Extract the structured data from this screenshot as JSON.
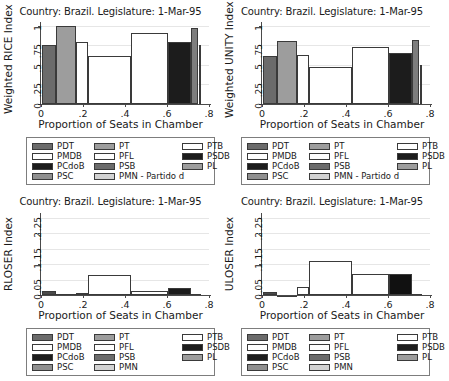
{
  "chart_data": [
    {
      "id": "weighted-rice",
      "type": "bar",
      "title": "Country: Brazil.  Legislature: 1-Mar-95",
      "xlabel": "Proportion of Seats in Chamber",
      "ylabel": "Weighted RICE Index",
      "xlim": [
        0,
        0.8
      ],
      "ylim": [
        0,
        1.05
      ],
      "xticks": [
        "0",
        ".2",
        ".4",
        ".6",
        ".8"
      ],
      "xtickvals": [
        0,
        0.2,
        0.4,
        0.6,
        0.8
      ],
      "yticks": [
        "0",
        ".25",
        ".5",
        ".75",
        "1"
      ],
      "ytickvals": [
        0,
        0.25,
        0.5,
        0.75,
        1
      ],
      "grid": true,
      "bars": [
        {
          "party": "PMDB_dark",
          "x0": 0.005,
          "x1": 0.072,
          "value": 0.75,
          "color": "#6b6b6b"
        },
        {
          "party": "PT",
          "x0": 0.072,
          "x1": 0.165,
          "value": 1.0,
          "color": "#9d9d9d"
        },
        {
          "party": "PFL",
          "x0": 0.165,
          "x1": 0.222,
          "value": 0.79,
          "color": "#ffffff"
        },
        {
          "party": "PPR",
          "x0": 0.222,
          "x1": 0.428,
          "value": 0.61,
          "color": "#ffffff"
        },
        {
          "party": "PTB",
          "x0": 0.428,
          "x1": 0.607,
          "value": 0.905,
          "color": "#ffffff"
        },
        {
          "party": "PSDB",
          "x0": 0.607,
          "x1": 0.715,
          "value": 0.8,
          "color": "#1c1c1c"
        },
        {
          "party": "PL",
          "x0": 0.715,
          "x1": 0.75,
          "value": 0.975,
          "color": "#7d7d7d"
        },
        {
          "party": "PMN",
          "x0": 0.75,
          "x1": 0.762,
          "value": 0.75,
          "color": "#ffffff"
        }
      ]
    },
    {
      "id": "weighted-unity",
      "type": "bar",
      "title": "Country: Brazil.  Legislature: 1-Mar-95",
      "xlabel": "Proportion of Seats in Chamber",
      "ylabel": "Weighted UNITY Index",
      "xlim": [
        0,
        0.8
      ],
      "ylim": [
        0,
        1.05
      ],
      "xticks": [
        "0",
        ".2",
        ".4",
        ".6",
        ".8"
      ],
      "xtickvals": [
        0,
        0.2,
        0.4,
        0.6,
        0.8
      ],
      "yticks": [
        "0",
        ".25",
        ".5",
        ".75",
        "1"
      ],
      "ytickvals": [
        0,
        0.25,
        0.5,
        0.75,
        1
      ],
      "grid": true,
      "bars": [
        {
          "party": "PMDB_dark",
          "x0": 0.005,
          "x1": 0.072,
          "value": 0.615,
          "color": "#6b6b6b"
        },
        {
          "party": "PT",
          "x0": 0.072,
          "x1": 0.165,
          "value": 0.805,
          "color": "#9d9d9d"
        },
        {
          "party": "PFL",
          "x0": 0.165,
          "x1": 0.222,
          "value": 0.625,
          "color": "#ffffff"
        },
        {
          "party": "PPR",
          "x0": 0.222,
          "x1": 0.428,
          "value": 0.48,
          "color": "#ffffff"
        },
        {
          "party": "PTB",
          "x0": 0.428,
          "x1": 0.607,
          "value": 0.735,
          "color": "#ffffff"
        },
        {
          "party": "PSDB",
          "x0": 0.607,
          "x1": 0.715,
          "value": 0.655,
          "color": "#1c1c1c"
        },
        {
          "party": "PL",
          "x0": 0.715,
          "x1": 0.75,
          "value": 0.815,
          "color": "#7d7d7d"
        },
        {
          "party": "PMN",
          "x0": 0.75,
          "x1": 0.762,
          "value": 0.5,
          "color": "#ffffff"
        }
      ]
    },
    {
      "id": "rloser",
      "type": "bar",
      "title": "Country: Brazil.  Legislature: 1-Mar-95",
      "xlabel": "Proportion of Seats in Chamber",
      "ylabel": "RLOSER Index",
      "xlim": [
        0,
        0.8
      ],
      "ylim": [
        0,
        0.265
      ],
      "xticks": [
        "0",
        ".2",
        ".4",
        ".6",
        ".8"
      ],
      "xtickvals": [
        0,
        0.2,
        0.4,
        0.6,
        0.8
      ],
      "yticks": [
        "0",
        ".05",
        ".1",
        ".15",
        ".2",
        ".25"
      ],
      "ytickvals": [
        0,
        0.05,
        0.1,
        0.15,
        0.2,
        0.25
      ],
      "grid": true,
      "bars": [
        {
          "party": "PMDB_dark",
          "x0": 0.005,
          "x1": 0.072,
          "value": 0.0125,
          "color": "#4a4a4a"
        },
        {
          "party": "PT",
          "x0": 0.072,
          "x1": 0.165,
          "value": 0.002,
          "color": "#ffffff"
        },
        {
          "party": "PFL",
          "x0": 0.165,
          "x1": 0.222,
          "value": 0.0075,
          "color": "#ffffff"
        },
        {
          "party": "PPR",
          "x0": 0.222,
          "x1": 0.428,
          "value": 0.0655,
          "color": "#ffffff"
        },
        {
          "party": "PTB",
          "x0": 0.428,
          "x1": 0.607,
          "value": 0.0135,
          "color": "#ffffff"
        },
        {
          "party": "PSDB",
          "x0": 0.607,
          "x1": 0.715,
          "value": 0.0215,
          "color": "#1c1c1c"
        },
        {
          "party": "PL",
          "x0": 0.715,
          "x1": 0.762,
          "value": 0.0035,
          "color": "#6b6b6b"
        }
      ]
    },
    {
      "id": "uloser",
      "type": "bar",
      "title": "Country: Brazil.  Legislature: 1-Mar-95",
      "xlabel": "Proportion of Seats in Chamber",
      "ylabel": "ULOSER Index",
      "xlim": [
        0,
        0.8
      ],
      "ylim": [
        0,
        0.265
      ],
      "xticks": [
        "0",
        ".2",
        ".4",
        ".6",
        ".8"
      ],
      "xtickvals": [
        0,
        0.2,
        0.4,
        0.6,
        0.8
      ],
      "yticks": [
        "0",
        ".05",
        ".1",
        ".15",
        ".2",
        ".25"
      ],
      "ytickvals": [
        0,
        0.05,
        0.1,
        0.15,
        0.2,
        0.25
      ],
      "grid": true,
      "bars": [
        {
          "party": "PMDB_dark",
          "x0": 0.005,
          "x1": 0.072,
          "value": 0.0095,
          "color": "#4a4a4a"
        },
        {
          "party": "PT",
          "x0": 0.072,
          "x1": 0.165,
          "value": 0.0015,
          "color": "#ffffff"
        },
        {
          "party": "PFL",
          "x0": 0.165,
          "x1": 0.222,
          "value": 0.0255,
          "color": "#ffffff"
        },
        {
          "party": "PPR",
          "x0": 0.222,
          "x1": 0.428,
          "value": 0.1095,
          "color": "#ffffff"
        },
        {
          "party": "PTB",
          "x0": 0.428,
          "x1": 0.607,
          "value": 0.0665,
          "color": "#ffffff"
        },
        {
          "party": "PSDB",
          "x0": 0.607,
          "x1": 0.715,
          "value": 0.0675,
          "color": "#111111"
        },
        {
          "party": "PL",
          "x0": 0.715,
          "x1": 0.762,
          "value": 0.004,
          "color": "#6b6b6b"
        }
      ]
    }
  ],
  "legends": {
    "full": [
      {
        "label": "PDT",
        "color": "#6b6b6b"
      },
      {
        "label": "PMDB",
        "color": "#ffffff"
      },
      {
        "label": "PCdoB",
        "color": "#1c1c1c"
      },
      {
        "label": "PSC",
        "color": "#8f8f8f"
      },
      {
        "label": "PT",
        "color": "#9d9d9d"
      },
      {
        "label": "PFL",
        "color": "#ffffff"
      },
      {
        "label": "PSB",
        "color": "#6b6b6b"
      },
      {
        "label": "PMN - Partido d",
        "color": "#d2d2d2"
      },
      {
        "label": "PTB",
        "color": "#ffffff"
      },
      {
        "label": "PSDB",
        "color": "#1c1c1c"
      },
      {
        "label": "PL",
        "color": "#9d9d9d"
      }
    ],
    "short": [
      {
        "label": "PDT",
        "color": "#6b6b6b"
      },
      {
        "label": "PMDB",
        "color": "#ffffff"
      },
      {
        "label": "PCdoB",
        "color": "#1c1c1c"
      },
      {
        "label": "PSC",
        "color": "#8f8f8f"
      },
      {
        "label": "PT",
        "color": "#9d9d9d"
      },
      {
        "label": "PFL",
        "color": "#ffffff"
      },
      {
        "label": "PSB",
        "color": "#6b6b6b"
      },
      {
        "label": "PMN",
        "color": "#d2d2d2"
      },
      {
        "label": "PTB",
        "color": "#ffffff"
      },
      {
        "label": "PSDB",
        "color": "#1c1c1c"
      },
      {
        "label": "PL",
        "color": "#9d9d9d"
      }
    ]
  },
  "colors": {
    "axis": "#4a4a4a",
    "grid": "#e6e6e6",
    "legend_border": "#7d7d7d",
    "bar_outline": "#3a3a3a",
    "background": "#ffffff"
  }
}
